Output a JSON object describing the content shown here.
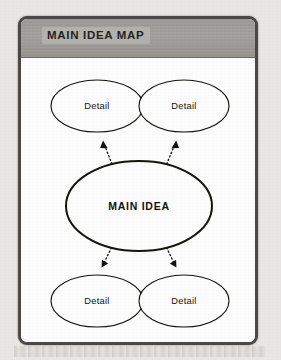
{
  "document": {
    "kind": "graphic-organizer-worksheet",
    "header": {
      "title": "MAIN IDEA MAP"
    }
  },
  "diagram": {
    "type": "bubble-map",
    "center_node": {
      "id": "main-idea",
      "label": "MAIN IDEA",
      "shape": "ellipse"
    },
    "detail_nodes": [
      {
        "id": "detail-top-left",
        "label": "Detail",
        "shape": "ellipse",
        "position": "top-left"
      },
      {
        "id": "detail-top-right",
        "label": "Detail",
        "shape": "ellipse",
        "position": "top-right"
      },
      {
        "id": "detail-bottom-left",
        "label": "Detail",
        "shape": "ellipse",
        "position": "bottom-left"
      },
      {
        "id": "detail-bottom-right",
        "label": "Detail",
        "shape": "ellipse",
        "position": "bottom-right"
      }
    ],
    "connectors": [
      {
        "id": "arrow-to-top-left",
        "from": "main-idea",
        "to": "detail-top-left",
        "style": "dotted",
        "arrowhead": "to"
      },
      {
        "id": "arrow-to-top-right",
        "from": "main-idea",
        "to": "detail-top-right",
        "style": "dotted",
        "arrowhead": "to"
      },
      {
        "id": "arrow-to-bottom-left",
        "from": "main-idea",
        "to": "detail-bottom-left",
        "style": "dotted",
        "arrowhead": "to"
      },
      {
        "id": "arrow-to-bottom-right",
        "from": "main-idea",
        "to": "detail-bottom-right",
        "style": "dotted",
        "arrowhead": "to"
      }
    ]
  },
  "colors": {
    "page_background": "#eceae7",
    "frame_border": "#4c4a48",
    "header_band": "#a5a39f",
    "canvas": "#ffffff",
    "ink": "#14120f"
  }
}
